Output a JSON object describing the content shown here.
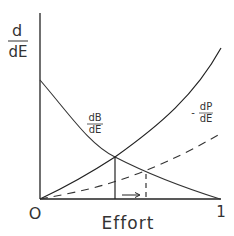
{
  "diagram": {
    "y_axis_label": {
      "numerator": "d",
      "denominator": "dE"
    },
    "x_axis_label": "Effort",
    "origin_label": "O",
    "x_end_label": "1",
    "curves": [
      {
        "id": "marginal-benefit",
        "style": "solid",
        "label_num": "dB",
        "label_den": "dE",
        "shape": "decreasing convex"
      },
      {
        "id": "marginal-cost",
        "style": "solid",
        "label_num": "",
        "label_den": "",
        "shape": "increasing convex"
      },
      {
        "id": "marginal-penalty",
        "style": "dashed",
        "label_prefix": "-",
        "label_num": "dP",
        "label_den": "dE",
        "shape": "increasing, shallow"
      }
    ],
    "annotations": {
      "solid_vertical": "from cost/benefit intersection to x-axis",
      "dashed_vertical": "from penalty/benefit intersection to x-axis",
      "arrow": "rightward shift along x-axis"
    },
    "colors": {
      "ink": "#222222",
      "background": "#ffffff"
    }
  }
}
